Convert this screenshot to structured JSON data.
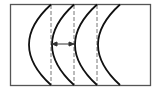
{
  "diagram": {
    "colors": {
      "background": "#ffffff",
      "frame": "#555555",
      "arc": "#111111",
      "dashed": "#777777",
      "arrow": "#333333"
    },
    "frame": {
      "x": 10,
      "y": 4,
      "width": 140,
      "height": 81
    },
    "dashed_lines_x": [
      51,
      74,
      97
    ],
    "arcs": [
      {
        "end_x": 51,
        "apex_x": 29
      },
      {
        "end_x": 74,
        "apex_x": 52
      },
      {
        "end_x": 97,
        "apex_x": 75
      },
      {
        "end_x": 120,
        "apex_x": 98
      }
    ],
    "arrow": {
      "x1": 52,
      "x2": 74,
      "y": 44,
      "type": "double-headed"
    }
  }
}
